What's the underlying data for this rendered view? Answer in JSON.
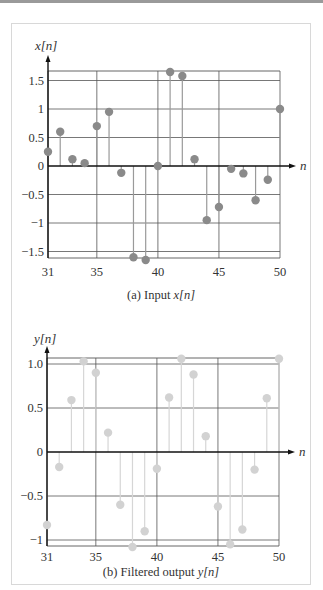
{
  "chart_data": [
    {
      "type": "stem",
      "title": "(a)  Input x[n]",
      "caption_prefix": "(a)  Input ",
      "caption_var": "x[n]",
      "ylabel": "x[n]",
      "xlabel": "n",
      "xlim": [
        31,
        50
      ],
      "ylim": [
        -1.65,
        1.65
      ],
      "xticks": [
        31,
        35,
        40,
        45,
        50
      ],
      "yticks": [
        -1.5,
        -1,
        -0.5,
        0,
        0.5,
        1,
        1.5
      ],
      "ytick_labels": [
        "−1.5",
        "−1",
        "−0.5",
        "0",
        "0.5",
        "1",
        "1.5"
      ],
      "grid": true,
      "marker_color": "#8a8a8a",
      "stem_color": "#9a9a9a",
      "x": [
        31,
        32,
        33,
        34,
        35,
        36,
        37,
        38,
        39,
        40,
        41,
        42,
        43,
        44,
        45,
        46,
        47,
        48,
        49,
        50
      ],
      "values": [
        0.25,
        0.6,
        0.12,
        0.05,
        0.7,
        0.95,
        -0.12,
        -1.6,
        -1.65,
        0.0,
        1.65,
        1.58,
        0.12,
        -0.95,
        -0.72,
        -0.05,
        -0.13,
        -0.6,
        -0.24,
        1.0
      ]
    },
    {
      "type": "stem",
      "title": "(b)  Filtered output y[n]",
      "caption_prefix": "(b)  Filtered output ",
      "caption_var": "y[n]",
      "ylabel": "y[n]",
      "xlabel": "n",
      "xlim": [
        31,
        50
      ],
      "ylim": [
        -1.07,
        1.07
      ],
      "xticks": [
        31,
        35,
        40,
        45,
        50
      ],
      "yticks": [
        -1,
        -0.5,
        0,
        0.5,
        1.0
      ],
      "ytick_labels": [
        "−1",
        "−0.5",
        "0",
        "0.5",
        "1.0"
      ],
      "grid": true,
      "marker_color": "#d2d2d2",
      "stem_color": "#d6d6d6",
      "x": [
        31,
        32,
        33,
        34,
        35,
        36,
        37,
        38,
        39,
        40,
        41,
        42,
        43,
        44,
        45,
        46,
        47,
        48,
        49,
        50
      ],
      "values": [
        -0.83,
        -0.17,
        0.59,
        1.03,
        0.9,
        0.22,
        -0.6,
        -1.08,
        -0.9,
        -0.19,
        0.62,
        1.06,
        0.88,
        0.18,
        -0.62,
        -1.05,
        -0.88,
        -0.2,
        0.61,
        1.06
      ]
    }
  ]
}
